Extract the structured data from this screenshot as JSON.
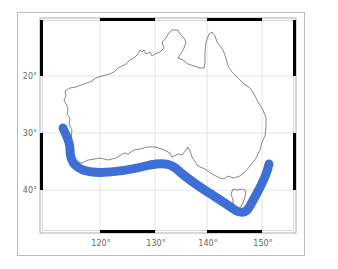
{
  "map": {
    "region": "Australia",
    "projection": "Mercator",
    "lon_range": [
      109,
      158
    ],
    "lat_range": [
      10,
      48
    ],
    "longitude_ticks": [
      {
        "value": 120,
        "label": "120°"
      },
      {
        "value": 130,
        "label": "130°"
      },
      {
        "value": 140,
        "label": "140°"
      },
      {
        "value": 150,
        "label": "150°"
      }
    ],
    "latitude_ticks": [
      {
        "value": 20,
        "label": "20°"
      },
      {
        "value": 30,
        "label": "30°"
      },
      {
        "value": 40,
        "label": "40°"
      }
    ],
    "gridlines": true,
    "colors": {
      "track": "#3d6fd6",
      "coastline": "#555555",
      "grid": "#dddddd",
      "frame": "#000000",
      "outer_border": "#bbbbbb",
      "background": "#ffffff"
    },
    "track": {
      "name": "southern-coast-band",
      "points_lonlat": [
        [
          113.5,
          28.5
        ],
        [
          115,
          32
        ],
        [
          115.5,
          35
        ],
        [
          117,
          37.5
        ],
        [
          120,
          38.5
        ],
        [
          125,
          38
        ],
        [
          130,
          36.5
        ],
        [
          133,
          37
        ],
        [
          137,
          40
        ],
        [
          141,
          42.5
        ],
        [
          144,
          44
        ],
        [
          147,
          44.5
        ],
        [
          149,
          41
        ],
        [
          152,
          34.5
        ]
      ]
    }
  }
}
